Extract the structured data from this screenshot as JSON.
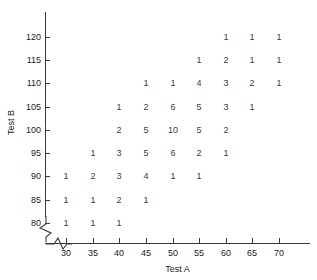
{
  "chart_data": {
    "type": "scatter",
    "title": "",
    "xlabel": "Test A",
    "ylabel": "Test B",
    "xlim": [
      26,
      74
    ],
    "ylim": [
      77,
      124
    ],
    "grid": false,
    "legend": null,
    "x_ticks": [
      30,
      35,
      40,
      45,
      50,
      55,
      60,
      65,
      70
    ],
    "y_ticks": [
      80,
      85,
      90,
      95,
      100,
      105,
      110,
      115,
      120
    ],
    "axis_break_x": true,
    "axis_break_y": true,
    "note": "Frequency/tally scatter: each plotted label is the count of observations at that (Test A, Test B) pair.",
    "points": [
      {
        "x": 60,
        "y": 120,
        "count": "1"
      },
      {
        "x": 65,
        "y": 120,
        "count": "1"
      },
      {
        "x": 70,
        "y": 120,
        "count": "1"
      },
      {
        "x": 55,
        "y": 115,
        "count": "1"
      },
      {
        "x": 60,
        "y": 115,
        "count": "2"
      },
      {
        "x": 65,
        "y": 115,
        "count": "1"
      },
      {
        "x": 70,
        "y": 115,
        "count": "1"
      },
      {
        "x": 45,
        "y": 110,
        "count": "1"
      },
      {
        "x": 50,
        "y": 110,
        "count": "1"
      },
      {
        "x": 55,
        "y": 110,
        "count": "4"
      },
      {
        "x": 60,
        "y": 110,
        "count": "3"
      },
      {
        "x": 65,
        "y": 110,
        "count": "2"
      },
      {
        "x": 70,
        "y": 110,
        "count": "1"
      },
      {
        "x": 40,
        "y": 105,
        "count": "1"
      },
      {
        "x": 45,
        "y": 105,
        "count": "2"
      },
      {
        "x": 50,
        "y": 105,
        "count": "6"
      },
      {
        "x": 55,
        "y": 105,
        "count": "5"
      },
      {
        "x": 60,
        "y": 105,
        "count": "3"
      },
      {
        "x": 65,
        "y": 105,
        "count": "1"
      },
      {
        "x": 40,
        "y": 100,
        "count": "2"
      },
      {
        "x": 45,
        "y": 100,
        "count": "5"
      },
      {
        "x": 50,
        "y": 100,
        "count": "10"
      },
      {
        "x": 55,
        "y": 100,
        "count": "5"
      },
      {
        "x": 60,
        "y": 100,
        "count": "2"
      },
      {
        "x": 35,
        "y": 95,
        "count": "1"
      },
      {
        "x": 40,
        "y": 95,
        "count": "3"
      },
      {
        "x": 45,
        "y": 95,
        "count": "5"
      },
      {
        "x": 50,
        "y": 95,
        "count": "6"
      },
      {
        "x": 55,
        "y": 95,
        "count": "2"
      },
      {
        "x": 60,
        "y": 95,
        "count": "1"
      },
      {
        "x": 30,
        "y": 90,
        "count": "1"
      },
      {
        "x": 35,
        "y": 90,
        "count": "2"
      },
      {
        "x": 40,
        "y": 90,
        "count": "3"
      },
      {
        "x": 45,
        "y": 90,
        "count": "4"
      },
      {
        "x": 50,
        "y": 90,
        "count": "1"
      },
      {
        "x": 55,
        "y": 90,
        "count": "1"
      },
      {
        "x": 30,
        "y": 85,
        "count": "1"
      },
      {
        "x": 35,
        "y": 85,
        "count": "1"
      },
      {
        "x": 40,
        "y": 85,
        "count": "2"
      },
      {
        "x": 45,
        "y": 85,
        "count": "1"
      },
      {
        "x": 30,
        "y": 80,
        "count": "1"
      },
      {
        "x": 35,
        "y": 80,
        "count": "1"
      },
      {
        "x": 40,
        "y": 80,
        "count": "1"
      }
    ]
  },
  "colors": {
    "axis": "#3a3a3a",
    "text": "#1a1a1a",
    "data_text": "#3c3c3c",
    "background": "#ffffff"
  }
}
